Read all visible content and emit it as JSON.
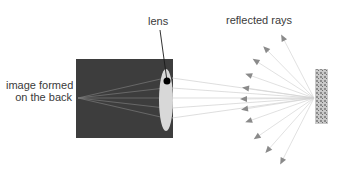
{
  "diagram": {
    "labels": {
      "lens": "lens",
      "reflected_rays": "reflected rays",
      "image_line1": "image formed",
      "image_line2": "on the back"
    },
    "colors": {
      "camera_body": "#3d3d3d",
      "lens": "#d8d8d8",
      "rays": "#cfcfcf",
      "arrowheads": "#8a8a8a",
      "object": "#a9a9a9",
      "text": "#3a3a3a"
    },
    "components": [
      "camera-body",
      "lens",
      "lens-pointer",
      "reflected-rays",
      "object",
      "image-point"
    ]
  }
}
